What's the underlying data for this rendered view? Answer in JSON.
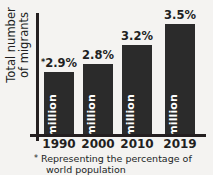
{
  "chart_data": {
    "type": "bar",
    "title": "",
    "xlabel": "",
    "ylabel": "Total number of migrants",
    "ylabel_lines": [
      "Total number",
      "of migrants"
    ],
    "categories": [
      "1990",
      "2000",
      "2010",
      "2019"
    ],
    "values": [
      153,
      174,
      221,
      272
    ],
    "value_unit": "million",
    "value_labels": [
      "153 million",
      "174 million",
      "221 million",
      "272 million"
    ],
    "percent_values": [
      2.9,
      2.8,
      3.2,
      3.5
    ],
    "percent_labels": [
      "2.9%",
      "2.8%",
      "3.2%",
      "3.5%"
    ],
    "percent_label_prefix": [
      "*",
      "",
      "",
      ""
    ],
    "ylim": [
      0,
      300
    ],
    "grid": false,
    "legend": "none",
    "footnote_star": "*",
    "footnote_line1": "Representing the percentage of",
    "footnote_line2": "world population",
    "footnote": "* Representing the percentage of world population",
    "colors": {
      "bar": "#2b2b2b",
      "axis": "#241f20",
      "background": "#f4f3f1",
      "bar_value_text": "#ffffff",
      "label_text": "#221f1f"
    }
  }
}
